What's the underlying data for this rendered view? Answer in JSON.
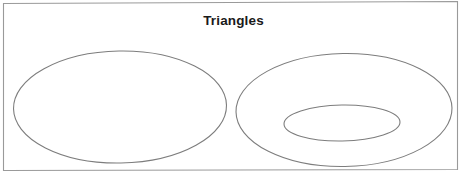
{
  "figure": {
    "title": "Triangles",
    "width": 467,
    "height": 176,
    "background_color": "#ffffff",
    "title_color": "#1a1a1a"
  },
  "frame": {
    "name": "figure-border",
    "stroke_color": "#9a9a9a",
    "stroke_width": 1.1,
    "fill": "none",
    "corners": [
      {
        "x": 3.5,
        "y": 3.5
      },
      {
        "x": 457.5,
        "y": 1.5
      },
      {
        "x": 457.5,
        "y": 169.5
      },
      {
        "x": 3.5,
        "y": 170.5
      }
    ]
  },
  "shapes": [
    {
      "name": "left-ellipse",
      "role": "set-a-outer",
      "cx": 120,
      "cy": 107,
      "rx": 106.5,
      "ry": 56,
      "rotation": -1,
      "stroke_color": "#7d7d7d",
      "stroke_width": 1.1,
      "fill": "none"
    },
    {
      "name": "right-outer-ellipse",
      "role": "set-b-outer",
      "cx": 344,
      "cy": 110,
      "rx": 108,
      "ry": 56.5,
      "rotation": -1,
      "stroke_color": "#7d7d7d",
      "stroke_width": 1.1,
      "fill": "none"
    },
    {
      "name": "right-inner-ellipse",
      "role": "set-b-inner",
      "cx": 342,
      "cy": 123,
      "rx": 58,
      "ry": 18,
      "rotation": -1,
      "stroke_color": "#7d7d7d",
      "stroke_width": 1.1,
      "fill": "none"
    }
  ],
  "chart_data": {
    "type": "diagram",
    "diagram_kind": "euler-venn",
    "title": "Triangles",
    "xlabel": "",
    "ylabel": "",
    "grid": false,
    "legend": "none",
    "regions": [
      {
        "id": "left-ellipse",
        "label": "",
        "relation": "disjoint",
        "contains": [],
        "center": [
          120,
          107
        ],
        "radii": [
          106.5,
          56
        ]
      },
      {
        "id": "right-outer-ellipse",
        "label": "",
        "relation": "contains",
        "contains": [
          "right-inner-ellipse"
        ],
        "center": [
          344,
          110
        ],
        "radii": [
          108,
          56.5
        ]
      },
      {
        "id": "right-inner-ellipse",
        "label": "",
        "relation": "subset-of",
        "contained_by": "right-outer-ellipse",
        "center": [
          342,
          123
        ],
        "radii": [
          58,
          18
        ]
      }
    ]
  }
}
